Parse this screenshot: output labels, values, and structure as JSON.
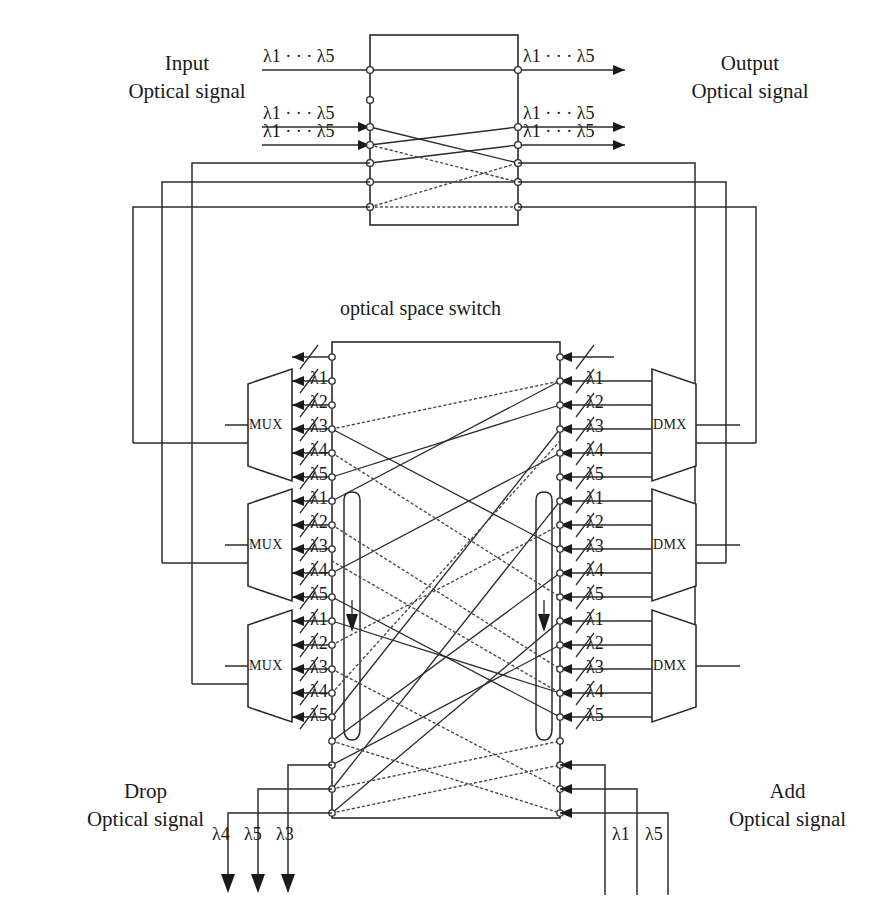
{
  "diagram": {
    "title": "optical space switch",
    "wavelength_symbol": "λ",
    "ellipsis": "· · ·"
  },
  "labels": {
    "input_line1": "Input",
    "input_line2": "Optical signal",
    "output_line1": "Output",
    "output_line2": "Optical signal",
    "drop_line1": "Drop",
    "drop_line2": "Optical signal",
    "add_line1": "Add",
    "add_line2": "Optical signal",
    "center_title": "optical space switch"
  },
  "blocks": {
    "mux_label": "MUX",
    "dmx_label": "DMX",
    "mux_count": 3,
    "dmx_count": 3
  },
  "channels": {
    "per_group": [
      "λ1",
      "λ2",
      "λ3",
      "λ4",
      "λ5"
    ],
    "subscripts": [
      "1",
      "2",
      "3",
      "4",
      "5"
    ]
  },
  "top_ports": {
    "input_labels": [
      "λ1 · · · λ5",
      "λ1 · · · λ5",
      "λ1 · · · λ5"
    ],
    "output_labels": [
      "λ1 · · · λ5",
      "λ1 · · · λ5",
      "λ1 · · · λ5"
    ]
  },
  "drop_signals": [
    "λ4",
    "λ5",
    "λ3"
  ],
  "add_signals": [
    "λ1",
    "λ5"
  ],
  "colors": {
    "line": "#2b2b2b",
    "dotted": "#4a4a4a",
    "background": "#ffffff",
    "text": "#1a1a1a"
  }
}
